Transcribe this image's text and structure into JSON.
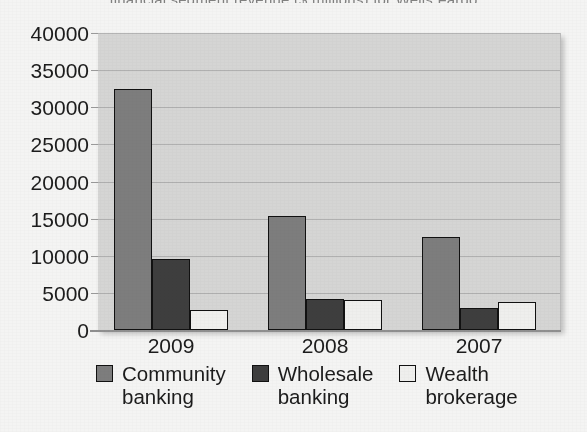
{
  "chart_data": {
    "type": "bar",
    "title": "",
    "xlabel": "",
    "ylabel": "",
    "categories": [
      "2009",
      "2008",
      "2007"
    ],
    "series": [
      {
        "name": "Community banking",
        "label_wrapped": "Community\nbanking",
        "color": "#7d7d7d",
        "values": [
          32500,
          15300,
          12500
        ]
      },
      {
        "name": "Wholesale banking",
        "label_wrapped": "Wholesale\nbanking",
        "color": "#3e3e3e",
        "values": [
          9500,
          4200,
          2900
        ]
      },
      {
        "name": "Wealth brokerage",
        "label_wrapped": "Wealth\nbrokerage",
        "color": "#efefed",
        "values": [
          2700,
          4100,
          3800
        ]
      }
    ],
    "ylim": [
      0,
      40000
    ],
    "ytick_values": [
      40000,
      35000,
      30000,
      25000,
      20000,
      15000,
      10000,
      5000,
      0
    ],
    "ytick_labels": [
      "40000",
      "35000",
      "30000",
      "25000",
      "20000",
      "15000",
      "10000",
      "5000",
      "0"
    ],
    "grid": true,
    "legend_position": "bottom"
  },
  "figure": {
    "plot_background": "#d5d5d4",
    "gridline_color": "#b0b0b0",
    "axis_color": "#8f8f8f",
    "text_color": "#1c1c1c",
    "cropped_title_fragment": "financial segment revenue  ($ millions) for Wells Fargo"
  }
}
